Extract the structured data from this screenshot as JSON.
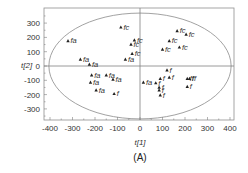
{
  "chart_data": {
    "type": "scatter",
    "title": "",
    "caption": "(A)",
    "xlabel": "t[1]",
    "ylabel": "t[2]",
    "xlim": [
      -420,
      420
    ],
    "ylim": [
      -390,
      390
    ],
    "xticks": [
      -400,
      -300,
      -200,
      -100,
      0,
      100,
      200,
      300,
      400
    ],
    "yticks": [
      -300,
      -200,
      -100,
      0,
      100,
      200,
      300
    ],
    "grid": false,
    "reference_lines": {
      "x0": true,
      "y0": true
    },
    "confidence_ellipse": {
      "cx": 0,
      "cy": 0,
      "rx": 405,
      "ry": 370
    },
    "marker": "triangle",
    "colors": {
      "axis": "#808080",
      "marker": "#222222",
      "label": "#333333",
      "ellipse": "#8a8a8a"
    },
    "points": [
      {
        "x": -320,
        "y": 175,
        "label": "fa"
      },
      {
        "x": -265,
        "y": 45,
        "label": "fa"
      },
      {
        "x": -225,
        "y": 10,
        "label": "fa"
      },
      {
        "x": -215,
        "y": -65,
        "label": "fa"
      },
      {
        "x": -220,
        "y": -115,
        "label": "fa"
      },
      {
        "x": -195,
        "y": -170,
        "label": "fa"
      },
      {
        "x": -150,
        "y": -65,
        "label": "fa"
      },
      {
        "x": -120,
        "y": -95,
        "label": "fa"
      },
      {
        "x": -115,
        "y": -195,
        "label": "f"
      },
      {
        "x": -65,
        "y": 45,
        "label": "fa"
      },
      {
        "x": -35,
        "y": 85,
        "label": "fc"
      },
      {
        "x": -85,
        "y": 270,
        "label": "fc"
      },
      {
        "x": -25,
        "y": 180,
        "label": "fc"
      },
      {
        "x": -40,
        "y": 150,
        "label": "fc"
      },
      {
        "x": 15,
        "y": -115,
        "label": "fa"
      },
      {
        "x": 70,
        "y": -120,
        "label": "f"
      },
      {
        "x": 90,
        "y": -90,
        "label": "f"
      },
      {
        "x": 85,
        "y": -150,
        "label": "f"
      },
      {
        "x": 85,
        "y": -170,
        "label": "f"
      },
      {
        "x": 90,
        "y": -205,
        "label": "f"
      },
      {
        "x": 130,
        "y": -80,
        "label": "f"
      },
      {
        "x": 120,
        "y": -30,
        "label": "f"
      },
      {
        "x": 100,
        "y": 115,
        "label": "fc"
      },
      {
        "x": 130,
        "y": 175,
        "label": "fc"
      },
      {
        "x": 175,
        "y": 130,
        "label": "fc"
      },
      {
        "x": 165,
        "y": 245,
        "label": "fc"
      },
      {
        "x": 205,
        "y": 220,
        "label": "fc"
      },
      {
        "x": 210,
        "y": -90,
        "label": "ff"
      },
      {
        "x": 220,
        "y": -90,
        "label": "ff"
      },
      {
        "x": 210,
        "y": -145,
        "label": "f"
      }
    ]
  }
}
